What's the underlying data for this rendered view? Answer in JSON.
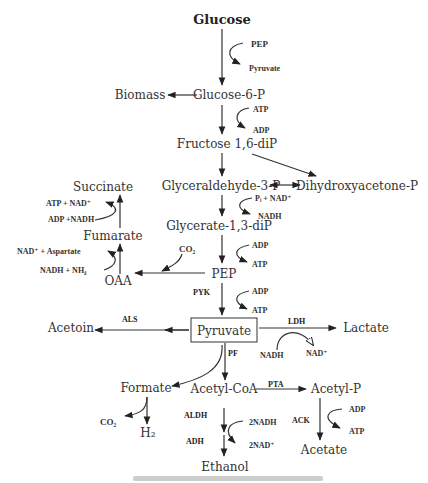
{
  "diagram": {
    "title": "Glucose",
    "metabolites": {
      "glucose": "Glucose",
      "glucose6p": "Glucose-6-P",
      "biomass": "Biomass",
      "fructose": "Fructose 1,6-diP",
      "g3p": "Glyceraldehyde-3-P",
      "dhap": "Dihydroxyacetone-P",
      "glycerate": "Glycerate-1,3-diP",
      "pep": "PEP",
      "oaa": "OAA",
      "fumarate": "Fumarate",
      "succinate": "Succinate",
      "pyruvate": "Pyruvate",
      "acetoin": "Acetoin",
      "lactate": "Lactate",
      "formate": "Formate",
      "acetylcoa": "Acetyl-CoA",
      "acetylp": "Acetyl-P",
      "ethanol": "Ethanol",
      "acetate": "Acetate",
      "h2": "H₂",
      "co2_formate": "CO₂"
    },
    "cofactors": {
      "pep_top": "PEP",
      "pyruvate_top": "Pyruvate",
      "atp1": "ATP",
      "adp1": "ADP",
      "pi_nad": "Pᵢ + NAD⁺",
      "nadh1": "NADH",
      "adp2": "ADP",
      "atp2": "ATP",
      "co2_pep": "CO₂",
      "adp3": "ADP",
      "atp3": "ATP",
      "atp_nad": "ATP + NAD⁺",
      "adp_nadh": "ADP +NADH",
      "nad_aspartate": "NAD⁺ + Aspartate",
      "nadh_nh4": "NADH + NH₄",
      "nadh_ldh": "NADH",
      "nad_ldh": "NAD⁺",
      "two_nadh": "2NADH",
      "two_nad": "2NAD⁺",
      "adp_ack": "ADP",
      "atp_ack": "ATP"
    },
    "enzymes": {
      "pyk": "PYK",
      "als": "ALS",
      "ldh": "LDH",
      "pf": "PF",
      "pta": "PTA",
      "aldh": "ALDH",
      "adh": "ADH",
      "ack": "ACK"
    }
  }
}
